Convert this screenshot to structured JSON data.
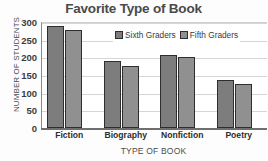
{
  "chart_data": {
    "type": "bar",
    "title": "Favorite Type of Book",
    "xlabel": "TYPE OF BOOK",
    "ylabel": "NUMBER OF STUDENTS",
    "categories": [
      "Fiction",
      "Biography",
      "Nonfiction",
      "Poetry"
    ],
    "series": [
      {
        "name": "Sixth Graders",
        "color": "#7d7d7d",
        "values": [
          290,
          190,
          208,
          137
        ]
      },
      {
        "name": "Fifth Graders",
        "color": "#909090",
        "values": [
          277,
          175,
          200,
          124
        ]
      }
    ],
    "ylim": [
      0,
      300
    ],
    "yticks": [
      0,
      50,
      100,
      150,
      200,
      250,
      300
    ],
    "ytick_labels": [
      "0",
      "50",
      "100",
      "150",
      "200",
      "250",
      "300"
    ],
    "grid": true,
    "legend_position": "top-right"
  }
}
